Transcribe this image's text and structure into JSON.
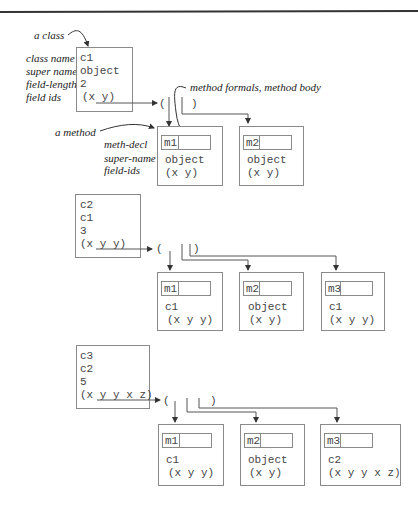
{
  "annotations": {
    "a_class": "a class",
    "a_method": "a method",
    "method_formals": "method formals, method body",
    "class_fields": [
      "class name",
      "super name",
      "field-length",
      "field ids"
    ],
    "method_fields": [
      "meth-decl",
      "super-name",
      "field-ids"
    ]
  },
  "classes": [
    {
      "name": "c1",
      "super": "object",
      "field_length": "2",
      "field_ids": "(x y)",
      "list_open": "(",
      "list_close": ")",
      "methods": [
        {
          "name": "m1",
          "super": "object",
          "field_ids": "(x y)"
        },
        {
          "name": "m2",
          "super": "object",
          "field_ids": "(x y)"
        }
      ]
    },
    {
      "name": "c2",
      "super": "c1",
      "field_length": "3",
      "field_ids": "(x y y)",
      "list_open": "(",
      "list_close": ")",
      "methods": [
        {
          "name": "m1",
          "super": "c1",
          "field_ids": "(x y y)"
        },
        {
          "name": "m2",
          "super": "object",
          "field_ids": "(x y)"
        },
        {
          "name": "m3",
          "super": "c1",
          "field_ids": "(x y y)"
        }
      ]
    },
    {
      "name": "c3",
      "super": "c2",
      "field_length": "5",
      "field_ids": "(x y y x z)",
      "list_open": "(",
      "list_close": ")",
      "methods": [
        {
          "name": "m1",
          "super": "c1",
          "field_ids": "(x y y)"
        },
        {
          "name": "m2",
          "super": "object",
          "field_ids": "(x y)"
        },
        {
          "name": "m3",
          "super": "c2",
          "field_ids": "(x y y x z)"
        }
      ]
    }
  ]
}
